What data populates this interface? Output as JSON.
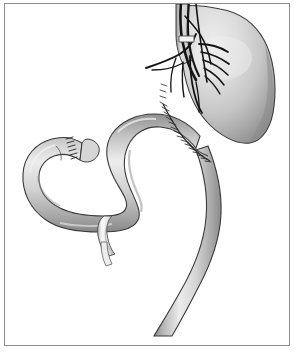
{
  "figure": {
    "domain_kind": "anatomical-line-illustration",
    "title": "Gastrojejunostomy with vagotomy and duodenal stump closure",
    "frame": {
      "border_color": "#8c8c8c",
      "background_color": "#ffffff",
      "x": 4,
      "y": 3,
      "width": 286,
      "height": 343
    },
    "palette": {
      "outline": "#3a3a3a",
      "tissue_light": "#e6e6e6",
      "tissue_mid": "#c9c9c9",
      "tissue_dark": "#9a9a9a",
      "tissue_shadow": "#7d7d7d",
      "nerve_dark": "#1a1a1a",
      "suture": "#2b2b2b",
      "ligature_pale": "#f2f2f2",
      "highlight": "#f4f4f4"
    },
    "structures": [
      {
        "id": "esophagus",
        "label": "Esophagus",
        "description": "Vertical tubular segment entering at top of frame, continuous with gastric cardia"
      },
      {
        "id": "vagus-nerve-trunks",
        "label": "Vagus nerve trunks and branches",
        "description": "Dark branching nerve fibers descending along the esophagus and fanning across the lesser curvature and gastric body"
      },
      {
        "id": "nerve-ligature-clip",
        "label": "Nerve ligature clip",
        "description": "Small pale band placed on the vagal trunk near the esophagus"
      },
      {
        "id": "stomach",
        "label": "Stomach (fundus and body)",
        "description": "Large rounded gastric pouch occupying the upper right of the field with graded shading"
      },
      {
        "id": "gastric-suture-line",
        "label": "Gastric staple / suture line",
        "description": "Interrupted hatched closure running down the lesser-curvature side of the stomach to the anastomosis"
      },
      {
        "id": "gastrojejunal-anastomosis",
        "label": "Gastrojejunal anastomosis",
        "description": "Junction where the jejunal limb is sewn to the inferior stomach"
      },
      {
        "id": "afferent-limb",
        "label": "Afferent jejunal limb",
        "description": "S-shaped bowel loop sweeping left from the anastomosis"
      },
      {
        "id": "duodenal-stump",
        "label": "Closed duodenal stump",
        "description": "Blind-ending bowel tip at upper left with transverse staple hatching"
      },
      {
        "id": "jejunal-ligature-band",
        "label": "Jejunal ligature band",
        "description": "Pale encircling tie around the bowel in the lower middle of the field with a short hanging tail"
      },
      {
        "id": "efferent-limb",
        "label": "Efferent jejunal limb",
        "description": "Bowel limb descending from the anastomosis toward the lower edge of the frame"
      }
    ]
  }
}
